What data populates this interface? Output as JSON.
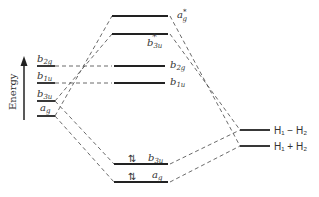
{
  "diagram": {
    "type": "molecular-orbital-energy-diagram",
    "axis_label": "Energy",
    "left_fragment_levels": [
      {
        "id": "L_b2g",
        "label_main": "b",
        "label_sub": "2g"
      },
      {
        "id": "L_b1u",
        "label_main": "b",
        "label_sub": "1u"
      },
      {
        "id": "L_b3u",
        "label_main": "b",
        "label_sub": "3u"
      },
      {
        "id": "L_ag",
        "label_main": "a",
        "label_sub": "g"
      }
    ],
    "molecular_orbitals": [
      {
        "id": "M_ag_star",
        "label_main": "a",
        "label_sub": "g",
        "label_sup": "*",
        "electrons": ""
      },
      {
        "id": "M_b3u_star",
        "label_main": "b",
        "label_sub": "3u",
        "label_sup": "*",
        "electrons": ""
      },
      {
        "id": "M_b2g",
        "label_main": "b",
        "label_sub": "2g",
        "label_sup": "",
        "electrons": ""
      },
      {
        "id": "M_b1u",
        "label_main": "b",
        "label_sub": "1u",
        "label_sup": "",
        "electrons": ""
      },
      {
        "id": "M_b3u",
        "label_main": "b",
        "label_sub": "3u",
        "label_sup": "",
        "electrons": "⇅"
      },
      {
        "id": "M_ag",
        "label_main": "a",
        "label_sub": "g",
        "label_sup": "",
        "electrons": "⇅"
      }
    ],
    "right_fragment_levels": [
      {
        "id": "R_minus",
        "label": "H₁ − H₂"
      },
      {
        "id": "R_plus",
        "label": "H₁ + H₂"
      }
    ],
    "correlations": [
      [
        "L_b2g",
        "M_b2g"
      ],
      [
        "L_b1u",
        "M_b1u"
      ],
      [
        "L_b3u",
        "M_b3u_star"
      ],
      [
        "L_ag",
        "M_ag_star"
      ],
      [
        "L_b3u",
        "M_b3u"
      ],
      [
        "L_ag",
        "M_ag"
      ],
      [
        "R_minus",
        "M_b3u_star"
      ],
      [
        "R_plus",
        "M_ag_star"
      ],
      [
        "R_minus",
        "M_b3u"
      ],
      [
        "R_plus",
        "M_ag"
      ]
    ]
  }
}
